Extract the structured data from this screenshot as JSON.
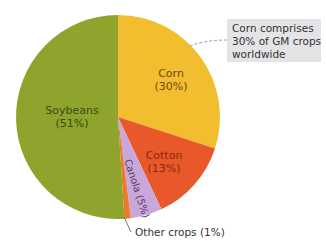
{
  "chart_data": {
    "type": "pie",
    "title": "",
    "slices": [
      {
        "name": "Corn",
        "value": 30,
        "label": "Corn",
        "pct_label": "(30%)",
        "color": "#f2bd2e"
      },
      {
        "name": "Cotton",
        "value": 13,
        "label": "Cotton",
        "pct_label": "(13%)",
        "color": "#e8582a"
      },
      {
        "name": "Canola",
        "value": 5,
        "label": "Canola (5%)",
        "color": "#c8a8d8"
      },
      {
        "name": "Other crops",
        "value": 1,
        "label": "Other crops (1%)",
        "color": "#ec7a2a"
      },
      {
        "name": "Soybeans",
        "value": 51,
        "label": "Soybeans",
        "pct_label": "(51%)",
        "color": "#8fa42c"
      }
    ],
    "annotations": [
      "Corn comprises 30% of GM crops worldwide"
    ],
    "start_angle": "12 o'clock, clockwise"
  },
  "labels": {
    "corn": "Corn",
    "corn_pct": "(30%)",
    "cotton": "Cotton",
    "cotton_pct": "(13%)",
    "canola": "Canola (5%)",
    "soybeans": "Soybeans",
    "soybeans_pct": "(51%)",
    "other": "Other crops (1%)"
  },
  "callout": {
    "line1": "Corn comprises",
    "line2": "30% of GM crops",
    "line3": "worldwide"
  }
}
